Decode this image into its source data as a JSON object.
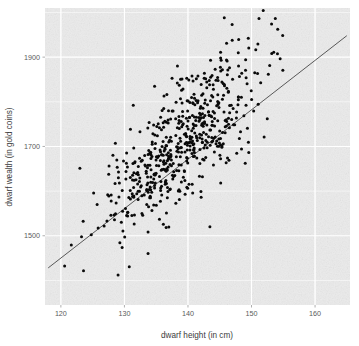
{
  "chart_data": {
    "type": "scatter",
    "title": "",
    "subtitle": "",
    "xlabel": "dwarf height (in cm)",
    "ylabel": "dwarf wealth (in gold coins)",
    "xlim": [
      117.5,
      165.5
    ],
    "ylim": [
      1345,
      2010
    ],
    "xticks": [
      120,
      130,
      140,
      150,
      160
    ],
    "xtick_labels": [
      "120",
      "130",
      "140",
      "150",
      "160"
    ],
    "yticks": [
      1500,
      1700,
      1900
    ],
    "ytick_labels": [
      "1500",
      "1700",
      "1900"
    ],
    "grid": true,
    "grid_color": "#ffffff",
    "panel_background": "#ebebeb",
    "legend": "none",
    "point_color": "#0a0a0a",
    "point_size": 3,
    "n_points": 600,
    "series": [
      {
        "name": "dwarves",
        "marker": "filled-circle",
        "x_mean": 139.5,
        "x_sd": 6.4,
        "y_mean": 1712,
        "y_sd": 108,
        "correlation": 0.78
      }
    ],
    "trend_line": {
      "type": "linear-fit",
      "color": "#585858",
      "slope": 13.2,
      "intercept": -129,
      "x_start": 118.0,
      "x_end": 165.0,
      "y_start": 1428,
      "y_end": 1948
    },
    "annotations": []
  },
  "figure": {
    "name": "dwarf-height-wealth-scatter",
    "width": 359,
    "height": 346
  }
}
